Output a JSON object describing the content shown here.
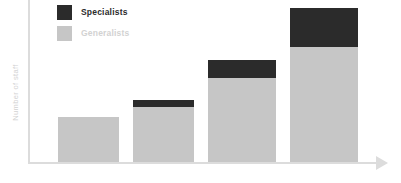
{
  "chart_data": {
    "type": "bar",
    "subtype": "stacked-bar",
    "title": "",
    "xlabel": "",
    "ylabel": "Number of staff",
    "grid": false,
    "legend_position": "top-left",
    "axis_ticks": false,
    "categories": [
      "1",
      "2",
      "3",
      "4"
    ],
    "ylim": [
      0,
      170
    ],
    "series": [
      {
        "name": "Generalists",
        "color": "#c6c6c6",
        "values": [
          47,
          58,
          88,
          121
        ]
      },
      {
        "name": "Specialists",
        "color": "#2b2b2b",
        "values": [
          0,
          7,
          19,
          41
        ]
      }
    ],
    "totals": [
      47,
      65,
      107,
      162
    ]
  },
  "axes": {
    "y_title": "Number of staff",
    "y_axis_color": "#dcdcdc",
    "x_axis_color": "#dcdcdc",
    "x_arrow_icon": "arrow-right-icon"
  },
  "legend": {
    "items": [
      {
        "label": "Specialists",
        "swatch_color": "#2b2b2b",
        "text_color": "#2b2b2b"
      },
      {
        "label": "Generalists",
        "swatch_color": "#c6c6c6",
        "text_color": "#d2d2d2"
      }
    ]
  },
  "colors": {
    "background": "#ffffff",
    "specialists": "#2b2b2b",
    "generalists": "#c6c6c6",
    "axis": "#dcdcdc",
    "muted_text": "#d2d2d2"
  }
}
